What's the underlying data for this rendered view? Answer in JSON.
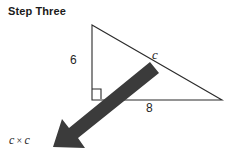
{
  "title": "Step Three",
  "diagram": {
    "type": "right-triangle",
    "labels": {
      "vertical_leg": "6",
      "horizontal_leg": "8",
      "hypotenuse": "c"
    },
    "right_angle_marker": true,
    "geometry": {
      "apex": [
        92,
        25
      ],
      "right_angle_vertex": [
        92,
        100
      ],
      "right_vertex": [
        222,
        100
      ],
      "stroke_color": "#2b2b2b",
      "stroke_width": 1
    }
  },
  "arrow": {
    "name": "emphasis-arrow",
    "color": "#3b3b3b",
    "direction": "down-left",
    "tail": [
      152,
      68
    ],
    "tip": [
      54,
      146
    ]
  },
  "result": {
    "left_operand": "c",
    "operator": "×",
    "right_operand": "c"
  }
}
